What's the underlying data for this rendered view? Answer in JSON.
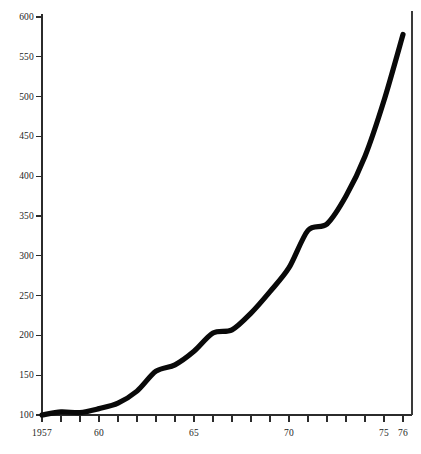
{
  "chart_data": {
    "type": "line",
    "title": "",
    "subtitle": "",
    "xlabel": "",
    "ylabel": "",
    "xlim": [
      1957,
      1976
    ],
    "ylim": [
      100,
      600
    ],
    "grid": false,
    "legend": null,
    "x": [
      1957,
      1958,
      1959,
      1960,
      1961,
      1962,
      1963,
      1964,
      1965,
      1966,
      1967,
      1968,
      1969,
      1970,
      1971,
      1972,
      1973,
      1974,
      1975,
      1976
    ],
    "values": [
      100,
      104,
      103,
      108,
      115,
      130,
      155,
      163,
      180,
      203,
      207,
      228,
      255,
      285,
      332,
      340,
      375,
      425,
      495,
      578
    ],
    "series": [
      {
        "name": "index",
        "color": "#090909",
        "values": [
          100,
          104,
          103,
          108,
          115,
          130,
          155,
          163,
          180,
          203,
          207,
          228,
          255,
          285,
          332,
          340,
          375,
          425,
          495,
          578
        ]
      }
    ],
    "y_ticks": [
      100,
      150,
      200,
      250,
      300,
      350,
      400,
      450,
      500,
      550,
      600
    ],
    "y_tick_labels": [
      "100",
      "150",
      "200",
      "250",
      "300",
      "350",
      "400",
      "450",
      "500",
      "550",
      "600"
    ],
    "x_ticks": [
      1957,
      1958,
      1959,
      1960,
      1961,
      1962,
      1963,
      1964,
      1965,
      1966,
      1967,
      1968,
      1969,
      1970,
      1971,
      1972,
      1973,
      1974,
      1975,
      1976
    ],
    "x_tick_labels": [
      {
        "year": 1957,
        "label": "1957"
      },
      {
        "year": 1960,
        "label": "60"
      },
      {
        "year": 1965,
        "label": "65"
      },
      {
        "year": 1970,
        "label": "70"
      },
      {
        "year": 1975,
        "label": "75"
      },
      {
        "year": 1976,
        "label": "76"
      }
    ],
    "annotations": [],
    "style": {
      "line_color": "#090909",
      "axis_color": "#2b2b2b",
      "background": "#ffffff",
      "line_width": 5.2
    }
  },
  "geometry": {
    "plot_left": 42,
    "plot_right": 403,
    "plot_top": 14,
    "plot_bottom": 415,
    "right_rule_x": 412,
    "right_rule_top": 11,
    "y_value_top": 600,
    "y_value_bottom": 100,
    "y_px_top": 17,
    "y_px_bottom": 415,
    "tick_len_x": 7,
    "tick_len_y": 6
  }
}
